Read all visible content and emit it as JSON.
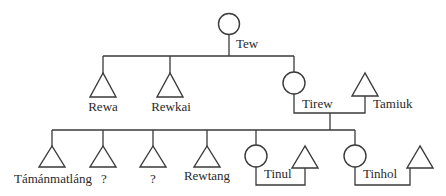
{
  "diagram": {
    "type": "kinship-chart",
    "people": {
      "tew": {
        "label": "Tew",
        "sex": "female"
      },
      "rewa": {
        "label": "Rewa",
        "sex": "male"
      },
      "rewkai": {
        "label": "Rewkai",
        "sex": "male"
      },
      "tirew": {
        "label": "Tirew",
        "sex": "female"
      },
      "tamiuk": {
        "label": "Tamiuk",
        "sex": "male"
      },
      "tamanmatlang": {
        "label": "Támánmatláng",
        "sex": "male"
      },
      "unknown1": {
        "label": "?",
        "sex": "male"
      },
      "unknown2": {
        "label": "?",
        "sex": "male"
      },
      "rewtang": {
        "label": "Rewtang",
        "sex": "male"
      },
      "tinul": {
        "label": "Tinul",
        "sex": "female"
      },
      "tinul_spouse": {
        "label": "",
        "sex": "male"
      },
      "tinhol": {
        "label": "Tinhol",
        "sex": "female"
      },
      "tinhol_spouse": {
        "label": "",
        "sex": "male"
      }
    },
    "relations": {
      "children_of_tew": [
        "rewa",
        "rewkai",
        "tirew"
      ],
      "marriages": [
        [
          "tirew",
          "tamiuk"
        ],
        [
          "tinul",
          "tinul_spouse"
        ],
        [
          "tinhol",
          "tinhol_spouse"
        ]
      ],
      "children_of_tirew_tamiuk": [
        "tamanmatlang",
        "unknown1",
        "unknown2",
        "rewtang",
        "tinul",
        "tinhol"
      ]
    },
    "legend": {
      "circle": "female",
      "triangle": "male"
    }
  }
}
